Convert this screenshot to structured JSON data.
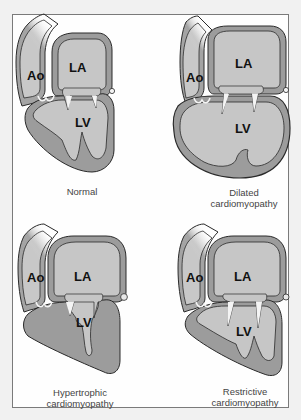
{
  "figure": {
    "panels": [
      {
        "id": "normal",
        "caption_lines": [
          "Normal"
        ],
        "labels": {
          "aorta": "Ao",
          "left_atrium": "LA",
          "left_ventricle": "LV"
        }
      },
      {
        "id": "dilated",
        "caption_lines": [
          "Dilated",
          "cardiomyopathy"
        ],
        "labels": {
          "aorta": "Ao",
          "left_atrium": "LA",
          "left_ventricle": "LV"
        }
      },
      {
        "id": "hypertrophic",
        "caption_lines": [
          "Hypertrophic",
          "cardiomyopathy"
        ],
        "labels": {
          "aorta": "Ao",
          "left_atrium": "LA",
          "left_ventricle": "LV"
        }
      },
      {
        "id": "restrictive",
        "caption_lines": [
          "Restrictive",
          "cardiomyopathy"
        ],
        "labels": {
          "aorta": "Ao",
          "left_atrium": "LA",
          "left_ventricle": "LV"
        }
      }
    ],
    "colors": {
      "background": "#f1f1f1",
      "panel": "#fefefe",
      "panel_border": "#7a7a7a",
      "chamber": "#c6c6c6",
      "wall": "#9c9c9c",
      "outline": "#2a2a2a",
      "valve": "#f4f4f4"
    }
  }
}
